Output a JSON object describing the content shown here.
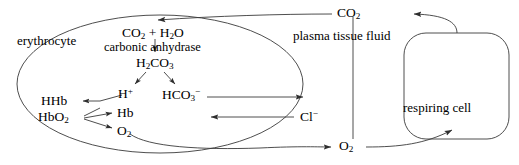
{
  "diagram": {
    "stroke_color": "#3a3a3a",
    "text_color": "#000000",
    "background_color": "#ffffff",
    "labels": {
      "erythrocyte": "erythrocyte",
      "plasma_tissue_fluid": "plasma tissue fluid",
      "respiring_cell": "respiring cell",
      "carbon_dioxide_water": "CO₂ + H₂O",
      "carbonic_anhydrase": "carbonic anhydrase",
      "carbonic_acid": "H₂CO₃",
      "hydrogen_ion": "H⁺",
      "bicarbonate": "HCO₃⁻",
      "hhb": "HHb",
      "hbo2": "HbO₂",
      "hb": "Hb",
      "oxygen_in_cell": "O₂",
      "chloride": "Cl⁻",
      "carbon_dioxide_external": "CO₂",
      "oxygen_external": "O₂"
    },
    "shapes": {
      "erythrocyte_outline": "ellipse",
      "respiring_cell_outline": "rounded-rectangle",
      "compartment_divider": "vertical-line"
    },
    "arrows": [
      {
        "name": "co2-into-erythrocyte",
        "from": "CO₂",
        "to": "CO₂ + H₂O",
        "direction": "left"
      },
      {
        "name": "co2-hydration",
        "from": "CO₂ + H₂O",
        "to": "H₂CO₃",
        "direction": "down"
      },
      {
        "name": "carbonic-acid-to-hydrogen",
        "from": "H₂CO₃",
        "to": "H⁺",
        "direction": "down-left"
      },
      {
        "name": "carbonic-acid-to-bicarbonate",
        "from": "H₂CO₃",
        "to": "HCO₃⁻",
        "direction": "down-right"
      },
      {
        "name": "hydrogen-to-hhb",
        "from": "H⁺",
        "to": "HHb",
        "direction": "left"
      },
      {
        "name": "hbo2-to-hhb",
        "from": "HbO₂",
        "to": "HHb",
        "direction": "left"
      },
      {
        "name": "hbo2-to-hb",
        "from": "HbO₂",
        "to": "Hb",
        "direction": "right"
      },
      {
        "name": "hbo2-to-o2",
        "from": "HbO₂",
        "to": "O₂",
        "direction": "down-right"
      },
      {
        "name": "bicarbonate-out",
        "from": "HCO₃⁻",
        "to": "plasma",
        "direction": "right"
      },
      {
        "name": "chloride-shift-in",
        "from": "Cl⁻",
        "to": "erythrocyte",
        "direction": "left"
      },
      {
        "name": "o2-out-to-plasma",
        "from": "O₂",
        "to": "O₂",
        "direction": "right"
      },
      {
        "name": "o2-into-respiring-cell",
        "from": "O₂",
        "to": "respiring cell",
        "direction": "up-right"
      },
      {
        "name": "co2-from-respiring-cell",
        "from": "respiring cell",
        "to": "CO₂",
        "direction": "left"
      }
    ]
  }
}
